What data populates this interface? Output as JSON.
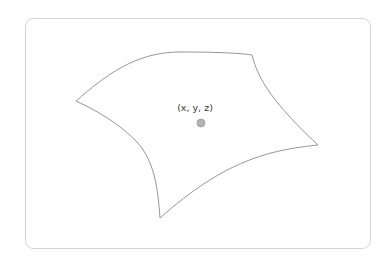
{
  "diagram": {
    "type": "parametric-surface-patch",
    "frame": {
      "x": 25,
      "y": 18,
      "width": 346,
      "height": 231,
      "radius": 8,
      "stroke_color": "#d4d4d4"
    },
    "surface_patch": {
      "stroke_color": "#8a8a8a",
      "vertices": {
        "left": [
          76,
          101
        ],
        "top_right": [
          252,
          55
        ],
        "right": [
          318,
          145
        ],
        "bottom": [
          160,
          218
        ]
      },
      "edges": [
        {
          "name": "top",
          "from": "left",
          "to": "top_right",
          "shape": "convex-up"
        },
        {
          "name": "right",
          "from": "top_right",
          "to": "right",
          "shape": "concave"
        },
        {
          "name": "bottom",
          "from": "right",
          "to": "bottom",
          "shape": "concave"
        },
        {
          "name": "left",
          "from": "bottom",
          "to": "left",
          "shape": "concave"
        }
      ]
    },
    "point": {
      "label": "(x, y, z)",
      "cx": 201,
      "cy": 123,
      "r": 4,
      "fill_color": "#b4b4b4"
    }
  }
}
